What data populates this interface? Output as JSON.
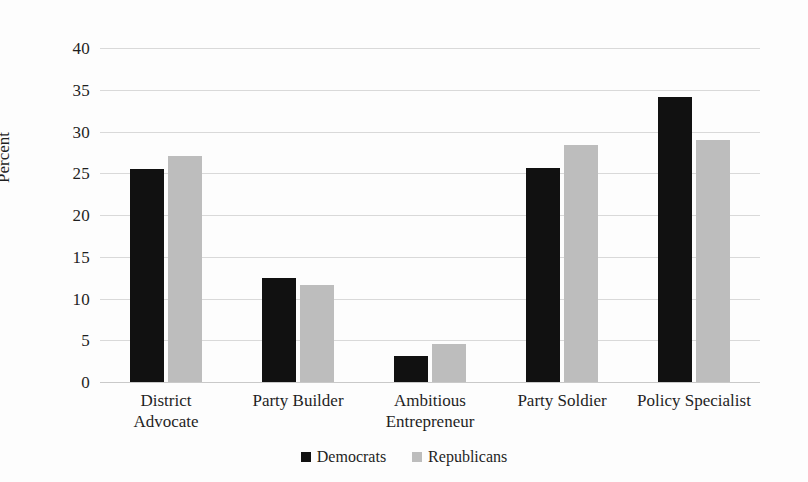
{
  "chart_data": {
    "type": "bar",
    "title": "",
    "subtitle": "",
    "xlabel": "",
    "ylabel": "Percent",
    "ylim": [
      0,
      40
    ],
    "yticks": [
      0,
      5,
      10,
      15,
      20,
      25,
      30,
      35,
      40
    ],
    "ytick_labels": [
      "0",
      "5",
      "10",
      "15",
      "20",
      "25",
      "30",
      "35",
      "40"
    ],
    "grid": true,
    "legend_position": "bottom-center",
    "categories": [
      "District Advocate",
      "Party Builder",
      "Ambitious Entrepreneur",
      "Party Soldier",
      "Policy Specialist"
    ],
    "category_lines": [
      [
        "District",
        "Advocate"
      ],
      [
        "Party Builder"
      ],
      [
        "Ambitious",
        "Entrepreneur"
      ],
      [
        "Party Soldier"
      ],
      [
        "Policy Specialist"
      ]
    ],
    "series": [
      {
        "name": "Democrats",
        "color": "#111111",
        "values": [
          25.5,
          12.4,
          3.1,
          25.6,
          34.1
        ]
      },
      {
        "name": "Republicans",
        "color": "#bdbdbd",
        "values": [
          27.1,
          11.6,
          4.6,
          28.4,
          29.0
        ]
      }
    ]
  },
  "legend": {
    "items": [
      {
        "label": "Democrats",
        "swatch": "black-square-icon"
      },
      {
        "label": "Republicans",
        "swatch": "gray-square-icon"
      }
    ]
  }
}
